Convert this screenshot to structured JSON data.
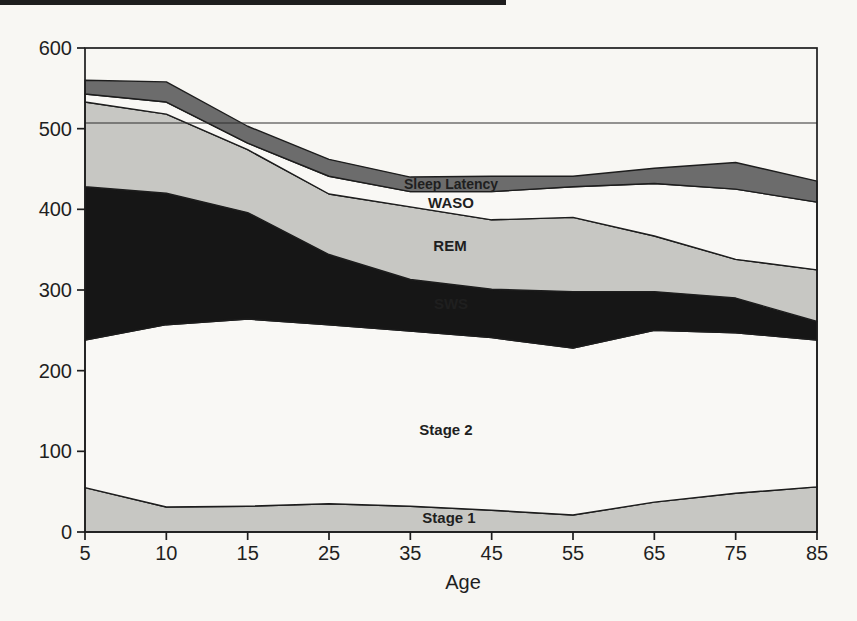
{
  "page": {
    "top_rule_color": "#1e1e1e",
    "paper_color": "#f8f7f3"
  },
  "chart_data": {
    "type": "area",
    "stacked": true,
    "title": "",
    "xlabel": "Age",
    "ylabel": "",
    "ylim": [
      0,
      600
    ],
    "y_ticks": [
      0,
      100,
      200,
      300,
      400,
      500,
      600
    ],
    "categories": [
      5,
      10,
      15,
      25,
      35,
      45,
      55,
      65,
      75,
      85
    ],
    "series": [
      {
        "name": "Stage 1",
        "color": "#c7c7c3",
        "values": [
          55,
          31,
          32,
          35,
          32,
          27,
          21,
          37,
          48,
          56
        ]
      },
      {
        "name": "Stage 2",
        "color": "#f9f8f5",
        "values": [
          183,
          226,
          232,
          222,
          217,
          214,
          207,
          213,
          199,
          182
        ]
      },
      {
        "name": "SWS",
        "color": "#161616",
        "values": [
          190,
          163,
          132,
          87,
          64,
          60,
          70,
          48,
          43,
          23
        ]
      },
      {
        "name": "REM",
        "color": "#c7c7c3",
        "values": [
          105,
          98,
          78,
          75,
          90,
          86,
          92,
          69,
          48,
          64
        ]
      },
      {
        "name": "WASO",
        "color": "#f9f8f5",
        "values": [
          10,
          15,
          8,
          22,
          19,
          35,
          38,
          65,
          87,
          84
        ]
      },
      {
        "name": "Sleep Latency",
        "color": "#6c6c6c",
        "values": [
          17,
          25,
          21,
          21,
          18,
          19,
          13,
          19,
          33,
          26
        ]
      }
    ],
    "totals_by_age": [
      560,
      558,
      503,
      462,
      440,
      441,
      441,
      451,
      458,
      435
    ],
    "reference_line": 507,
    "grid": "single horizontal line just above 500",
    "legend_position": "labels printed inside bands",
    "line_color": "#1d1d1d",
    "annotations": [
      {
        "text": "Sleep Latency",
        "x": 451,
        "y": 184,
        "color": "#f4f3f0",
        "size": 14
      },
      {
        "text": "WASO",
        "x": 451,
        "y": 202,
        "color": "#171717",
        "size": 15
      },
      {
        "text": "REM",
        "x": 450,
        "y": 245,
        "color": "#171717",
        "size": 15
      },
      {
        "text": "SWS",
        "x": 451,
        "y": 303,
        "color": "#f4f3f0",
        "size": 15
      },
      {
        "text": "Stage 2",
        "x": 446,
        "y": 429,
        "color": "#171717",
        "size": 15
      },
      {
        "text": "Stage 1",
        "x": 449,
        "y": 517,
        "color": "#171717",
        "size": 15
      }
    ]
  }
}
